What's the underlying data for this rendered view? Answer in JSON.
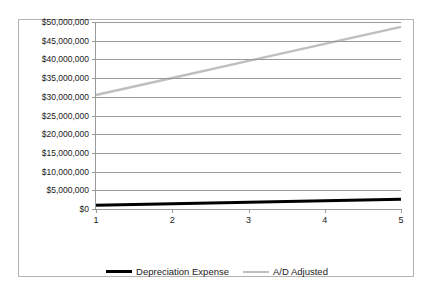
{
  "chart_data": {
    "type": "line",
    "title": "",
    "subtitle": "",
    "xlabel": "",
    "ylabel": "",
    "x": [
      1,
      2,
      3,
      4,
      5
    ],
    "xtick_labels": [
      "1",
      "2",
      "3",
      "4",
      "5"
    ],
    "ytick_labels": [
      "$50,000,000",
      "$45,000,000",
      "$40,000,000",
      "$35,000,000",
      "$30,000,000",
      "$25,000,000",
      "$20,000,000",
      "$15,000,000",
      "$10,000,000",
      "$5,000,000",
      "$0"
    ],
    "ytick_values": [
      50000000,
      45000000,
      40000000,
      35000000,
      30000000,
      25000000,
      20000000,
      15000000,
      10000000,
      5000000,
      0
    ],
    "ylim": [
      0,
      50000000
    ],
    "xlim": [
      1,
      5
    ],
    "grid": true,
    "legend_position": "bottom",
    "series": [
      {
        "name": "Depreciation Expense",
        "color": "#000000",
        "width": 3,
        "values": [
          1000000,
          1400000,
          1800000,
          2200000,
          2600000
        ]
      },
      {
        "name": "A/D Adjusted",
        "color": "#bfbfbf",
        "width": 2.5,
        "values": [
          30500000,
          35050000,
          39600000,
          44150000,
          48700000
        ]
      }
    ]
  },
  "legend": {
    "entries": [
      {
        "label": "Depreciation Expense"
      },
      {
        "label": "A/D Adjusted"
      }
    ]
  }
}
